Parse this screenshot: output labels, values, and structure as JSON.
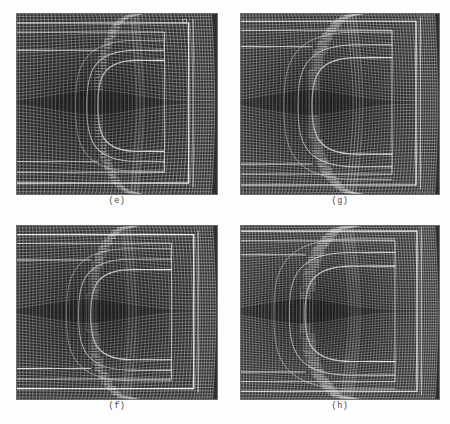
{
  "figure": {
    "kind": "multi-panel-grid-figure",
    "background_color": "#fdfdfd",
    "panel_background_color": "#2b2b2b",
    "mesh_line_color": "#ffffff",
    "caption_color": "#4a4a4a",
    "width": 450,
    "height": 424
  },
  "panels": [
    {
      "id": "panel-e",
      "caption": "(e)",
      "x": 16,
      "y": 13,
      "w": 202,
      "h": 182,
      "caption_y": 196,
      "body_front_x": 0.6,
      "body_top_y": 0.26,
      "body_bot_y": 0.76,
      "body_nose_r": 0.195,
      "outer_frame_x": 0.855,
      "outer_frame_top": 0.055,
      "outer_frame_bot": 0.935,
      "inner_frame_x": 0.735,
      "inner_frame_top": 0.105,
      "inner_frame_bot": 0.875,
      "nx": 62,
      "ny": 54,
      "clustering": 0.42,
      "shock_offset": 0.055,
      "wake_band_top": 0.205,
      "wake_band_bot": 0.815,
      "marker_visible": true,
      "marker_x": 0.835,
      "marker_y": 0.045
    },
    {
      "id": "panel-g",
      "caption": "(g)",
      "x": 240,
      "y": 13,
      "w": 200,
      "h": 182,
      "caption_y": 196,
      "body_front_x": 0.585,
      "body_top_y": 0.245,
      "body_bot_y": 0.775,
      "body_nose_r": 0.225,
      "outer_frame_x": 0.88,
      "outer_frame_top": 0.045,
      "outer_frame_bot": 0.945,
      "inner_frame_x": 0.76,
      "inner_frame_top": 0.095,
      "inner_frame_bot": 0.885,
      "nx": 70,
      "ny": 60,
      "clustering": 0.52,
      "shock_offset": 0.07,
      "wake_band_top": 0.185,
      "wake_band_bot": 0.83,
      "marker_visible": false,
      "marker_x": 0.0,
      "marker_y": 0.0
    },
    {
      "id": "panel-f",
      "caption": "(f)",
      "x": 16,
      "y": 225,
      "w": 202,
      "h": 175,
      "caption_y": 401,
      "body_front_x": 0.575,
      "body_top_y": 0.255,
      "body_bot_y": 0.77,
      "body_nose_r": 0.205,
      "outer_frame_x": 0.88,
      "outer_frame_top": 0.055,
      "outer_frame_bot": 0.935,
      "inner_frame_x": 0.77,
      "inner_frame_top": 0.105,
      "inner_frame_bot": 0.88,
      "nx": 66,
      "ny": 56,
      "clustering": 0.46,
      "shock_offset": 0.06,
      "wake_band_top": 0.2,
      "wake_band_bot": 0.82,
      "marker_visible": false,
      "marker_x": 0.0,
      "marker_y": 0.0
    },
    {
      "id": "panel-h",
      "caption": "(h)",
      "x": 240,
      "y": 225,
      "w": 200,
      "h": 175,
      "caption_y": 401,
      "body_front_x": 0.56,
      "body_top_y": 0.235,
      "body_bot_y": 0.78,
      "body_nose_r": 0.235,
      "outer_frame_x": 0.885,
      "outer_frame_top": 0.035,
      "outer_frame_bot": 0.95,
      "inner_frame_x": 0.775,
      "inner_frame_top": 0.09,
      "inner_frame_bot": 0.895,
      "nx": 76,
      "ny": 64,
      "clustering": 0.58,
      "shock_offset": 0.078,
      "wake_band_top": 0.17,
      "wake_band_bot": 0.84,
      "marker_visible": false,
      "marker_x": 0.0,
      "marker_y": 0.0
    }
  ]
}
